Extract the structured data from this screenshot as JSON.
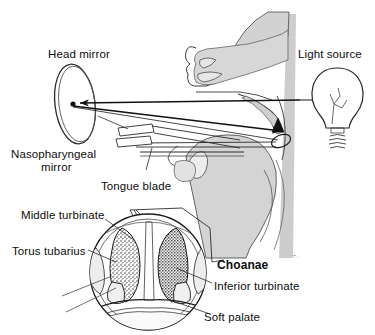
{
  "figure": {
    "background_color": "#ffffff",
    "ink_color": "#111111",
    "shade_color": "#c9c9c9"
  },
  "labels": {
    "head_mirror": "Head mirror",
    "light_source": "Light source",
    "nasopharyngeal_mirror_line1": "Nasopharyngeal",
    "nasopharyngeal_mirror_line2": "mirror",
    "tongue_blade": "Tongue blade",
    "middle_turbinate": "Middle turbinate",
    "torus_tubarius": "Torus tubarius",
    "choanae": "Choanae",
    "inferior_turbinate": "Inferior turbinate",
    "soft_palate": "Soft palate"
  },
  "icons": {
    "light_bulb": "light-bulb-icon",
    "head_mirror_disc": "head-mirror-icon",
    "arrow_incident": "arrow-left-icon",
    "arrow_reflected": "arrow-right-icon",
    "mirror_tip_arrow": "arrow-up-icon"
  }
}
